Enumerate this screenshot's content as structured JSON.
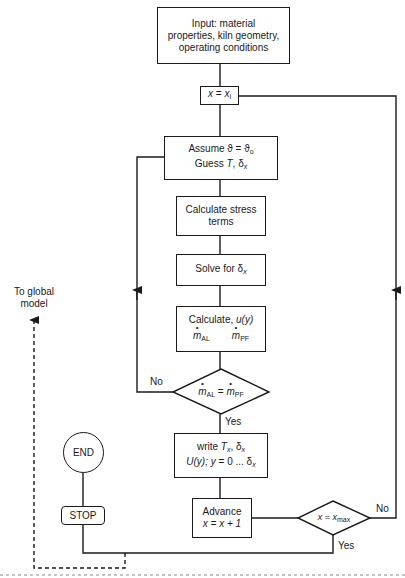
{
  "nodes": {
    "input": {
      "lines": [
        "Input: material",
        "properties, kiln geometry,",
        "operating conditions"
      ]
    },
    "init_x": {
      "lhs": "x",
      "eq": " = ",
      "rhs": "x",
      "rhs_sub": "i"
    },
    "assume": {
      "line1_a": "Assume ",
      "line1_b": "ϑ = ϑ",
      "line1_sub": "o",
      "line2_a": "Guess ",
      "line2_b": "T",
      "line2_c": ", δ",
      "line2_sub": "x"
    },
    "stress": {
      "lines": [
        "Calculate stress",
        "terms"
      ]
    },
    "solve": {
      "text": "Solve for δ",
      "sub": "x"
    },
    "calculate": {
      "line1_a": "Calculate, ",
      "line1_b": "u(y)",
      "m1": "m",
      "m1_sub": "AL",
      "m2": "m",
      "m2_sub": "PF"
    },
    "decision_mass": {
      "m1": "m",
      "m1_sub": "AL",
      "eq": " = ",
      "m2": "m",
      "m2_sub": "PF"
    },
    "write": {
      "line1_a": "write ",
      "line1_b": "T",
      "line1_sub": "x",
      "line1_c": ", δ",
      "line1_sub2": "x",
      "line2_a": "U(y); y",
      "line2_b": " = 0 ... δ",
      "line2_sub": "x"
    },
    "advance": {
      "line1": "Advance",
      "line2": "x = x + 1"
    },
    "decision_xmax": {
      "lhs": "x",
      "eq": " = ",
      "rhs": "x",
      "rhs_sub": "max"
    },
    "stop": {
      "text": "STOP"
    },
    "end": {
      "text": "END"
    }
  },
  "edge_labels": {
    "mass_no": "No",
    "mass_yes": "Yes",
    "xmax_no": "No",
    "xmax_yes": "Yes",
    "global": [
      "To global",
      "model"
    ]
  }
}
